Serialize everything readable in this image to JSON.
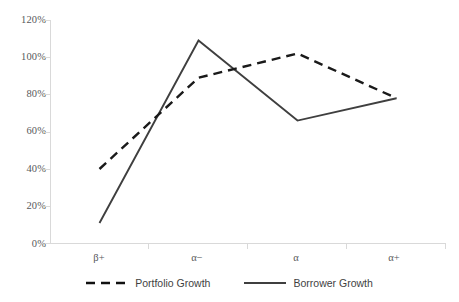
{
  "chart_data": {
    "type": "line",
    "title": "",
    "xlabel": "",
    "ylabel": "",
    "categories": [
      "β+",
      "α−",
      "α",
      "α+"
    ],
    "series": [
      {
        "name": "Portfolio Growth",
        "style": "dashed",
        "color": "#1a1a1a",
        "values": [
          40,
          89,
          102,
          78
        ]
      },
      {
        "name": "Borrower Growth",
        "style": "solid",
        "color": "#3f3f3f",
        "values": [
          11,
          109,
          66,
          78
        ]
      }
    ],
    "ylim": [
      0,
      120
    ],
    "ytick_values": [
      0,
      20,
      40,
      60,
      80,
      100,
      120
    ],
    "ytick_labels": [
      "0%",
      "20%",
      "40%",
      "60%",
      "80%",
      "100%",
      "120%"
    ],
    "grid": false,
    "legend_position": "bottom"
  },
  "axes": {
    "y_axis_color": "#d9d9d9",
    "x_axis_color": "#d9d9d9",
    "tick_color": "#d9d9d9"
  },
  "legend": {
    "items": [
      {
        "label": "Portfolio Growth",
        "style": "dashed"
      },
      {
        "label": "Borrower Growth",
        "style": "solid"
      }
    ]
  }
}
